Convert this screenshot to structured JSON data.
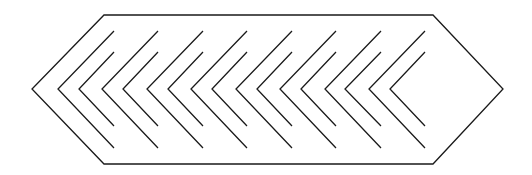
{
  "diagram": {
    "title": "",
    "stroke_color": "#1a1a1a",
    "background": "#ffffff",
    "outline": {
      "shape": "elongated-hexagon",
      "points": [
        [
          104,
          15
        ],
        [
          433,
          15
        ],
        [
          503,
          89
        ],
        [
          433,
          164
        ],
        [
          104,
          164
        ],
        [
          32,
          89
        ]
      ]
    },
    "chevron_pairs": [
      {
        "outer_tip": [
          58,
          89
        ],
        "inner_tip": [
          79,
          89
        ],
        "right_x": 114
      },
      {
        "outer_tip": [
          102,
          89
        ],
        "inner_tip": [
          123,
          89
        ],
        "right_x": 158
      },
      {
        "outer_tip": [
          147,
          89
        ],
        "inner_tip": [
          168,
          89
        ],
        "right_x": 203
      },
      {
        "outer_tip": [
          191,
          89
        ],
        "inner_tip": [
          212,
          89
        ],
        "right_x": 247
      },
      {
        "outer_tip": [
          236,
          89
        ],
        "inner_tip": [
          257,
          89
        ],
        "right_x": 292
      },
      {
        "outer_tip": [
          280,
          89
        ],
        "inner_tip": [
          301,
          89
        ],
        "right_x": 336
      },
      {
        "outer_tip": [
          325,
          89
        ],
        "inner_tip": [
          345,
          89
        ],
        "right_x": 381
      },
      {
        "outer_tip": [
          369,
          89
        ],
        "inner_tip": [
          390,
          89
        ],
        "right_x": 425
      }
    ],
    "chevron_y": {
      "outer_top": 31,
      "inner_top": 52,
      "inner_bottom": 126,
      "outer_bottom": 148
    }
  }
}
